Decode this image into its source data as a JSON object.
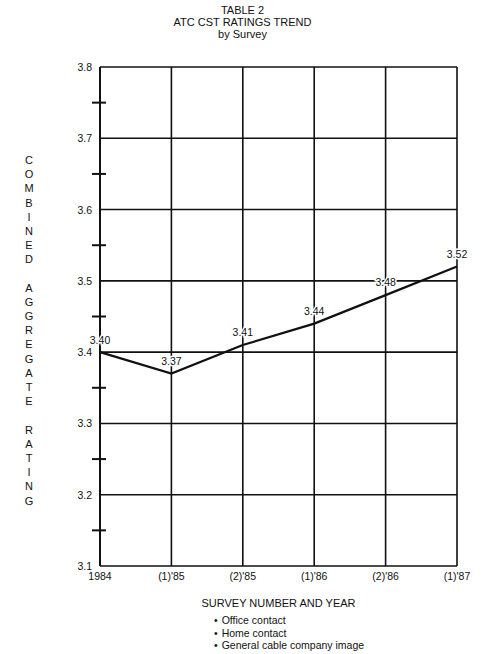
{
  "header": {
    "table_label": "TABLE 2",
    "title": "ATC CST RATINGS TREND",
    "subtitle": "by Survey"
  },
  "chart_data": {
    "type": "line",
    "xlabel": "SURVEY NUMBER AND YEAR",
    "ylabel": "COMBINED AGGREGATE RATING",
    "categories": [
      "1984",
      "(1)'85",
      "(2)'85",
      "(1)'86",
      "(2)'86",
      "(1)'87"
    ],
    "series": [
      {
        "name": "CST Rating",
        "values": [
          3.4,
          3.37,
          3.41,
          3.44,
          3.48,
          3.52
        ]
      }
    ],
    "data_labels": [
      "3.40",
      "3.37",
      "3.41",
      "3.44",
      "3.48",
      "3.52"
    ],
    "y_ticks": [
      "3.1",
      "3.2",
      "3.3",
      "3.4",
      "3.5",
      "3.6",
      "3.7",
      "3.8"
    ],
    "ylim": [
      3.1,
      3.8
    ],
    "grid": true,
    "minor_ticks_left_axis": true,
    "legend_notes": [
      "Office contact",
      "Home contact",
      "General cable company image"
    ]
  },
  "axis": {
    "ylabel_letters": [
      "C",
      "O",
      "M",
      "B",
      "I",
      "N",
      "E",
      "D",
      "",
      "A",
      "G",
      "G",
      "R",
      "E",
      "G",
      "A",
      "T",
      "E",
      "",
      "R",
      "A",
      "T",
      "I",
      "N",
      "G"
    ],
    "xlabel": "SURVEY NUMBER AND YEAR"
  },
  "legend": {
    "items": [
      "Office contact",
      "Home contact",
      "General cable company image"
    ]
  },
  "colors": {
    "ink": "#111111",
    "background": "#ffffff"
  }
}
